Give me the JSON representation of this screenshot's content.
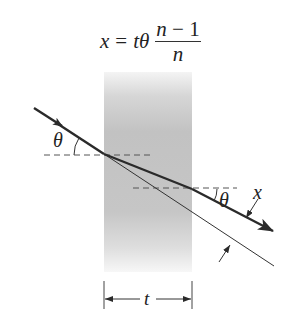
{
  "formula": {
    "lhs": "x",
    "equals": "=",
    "factor": "tθ",
    "numerator_var": "n",
    "numerator_op": " − ",
    "numerator_const": "1",
    "denominator": "n"
  },
  "labels": {
    "theta_incident": "θ",
    "theta_exit": "θ",
    "displacement": "x",
    "thickness": "t"
  },
  "colors": {
    "ray": "#2a2a2a",
    "slab_dark": "#bdbdbd",
    "slab_light": "#f4f4f4",
    "dashed": "#555555",
    "background": "#ffffff"
  }
}
